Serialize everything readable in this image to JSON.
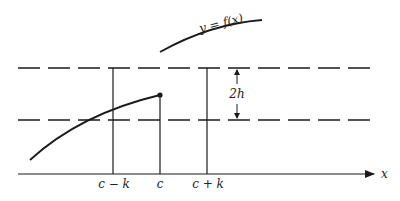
{
  "figure": {
    "curve_label": "y = f(x)",
    "axis_label": "x",
    "tick_labels": {
      "left": "c − k",
      "center": "c",
      "right": "c + k"
    },
    "band_label": "2h",
    "colors": {
      "stroke": "#1a1a1a",
      "background": "#ffffff"
    }
  }
}
